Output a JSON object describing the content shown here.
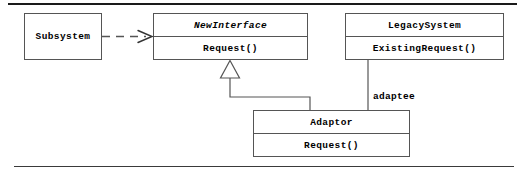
{
  "diagram": {
    "type": "uml-class-diagram",
    "colors": {
      "box_stroke": "#555555",
      "box_fill": "#ffffff",
      "connector_stroke": "#555555",
      "text": "#000000",
      "rule_top": "#1a1a1a",
      "rule_bottom": "#3a3a3a"
    },
    "classes": [
      {
        "id": "subsystem",
        "name": "Subsystem",
        "abstract": false,
        "compartments": [
          "Subsystem"
        ]
      },
      {
        "id": "newinterface",
        "name": "NewInterface",
        "abstract": true,
        "compartments": [
          "NewInterface",
          "Request()"
        ],
        "operations": [
          "Request()"
        ]
      },
      {
        "id": "legacysystem",
        "name": "LegacySystem",
        "abstract": false,
        "compartments": [
          "LegacySystem",
          "ExistingRequest()"
        ],
        "operations": [
          "ExistingRequest()"
        ]
      },
      {
        "id": "adaptor",
        "name": "Adaptor",
        "abstract": false,
        "compartments": [
          "Adaptor",
          "Request()"
        ],
        "operations": [
          "Request()"
        ]
      }
    ],
    "relationships": [
      {
        "id": "dependency-subsystem-newinterface",
        "kind": "dependency",
        "line": "dashed",
        "arrowhead": "open",
        "from": "Subsystem",
        "to": "NewInterface",
        "label": ""
      },
      {
        "id": "generalization-adaptor-newinterface",
        "kind": "generalization",
        "line": "solid",
        "arrowhead": "hollow-triangle",
        "from": "Adaptor",
        "to": "NewInterface",
        "label": ""
      },
      {
        "id": "association-adaptor-legacysystem",
        "kind": "association",
        "line": "solid",
        "arrowhead": "none",
        "from": "Adaptor",
        "to": "LegacySystem",
        "label": "adaptee"
      }
    ]
  }
}
